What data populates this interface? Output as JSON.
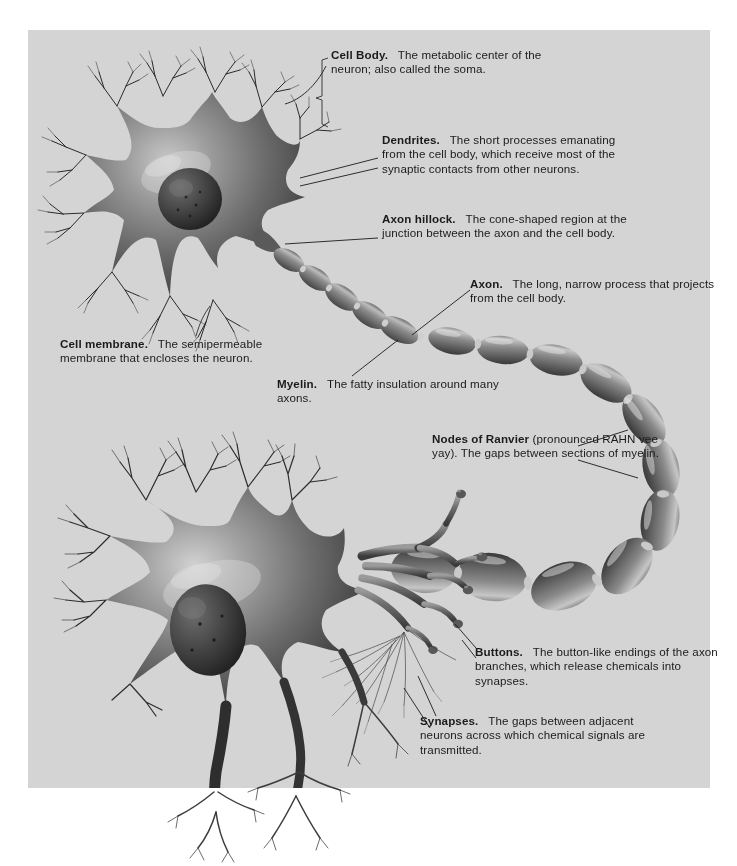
{
  "figure": {
    "panel_color": "#d4d4d4",
    "page_color": "#ffffff",
    "text_color": "#1b1b1b"
  },
  "callouts": [
    {
      "id": "cell-body",
      "term": "Cell Body.",
      "body": "The metabolic center of the neuron; also called the soma."
    },
    {
      "id": "dendrites",
      "term": "Dendrites.",
      "body": "The short processes emanating from the cell body, which receive most of the synaptic contacts from other neurons."
    },
    {
      "id": "axon-hillock",
      "term": "Axon hillock.",
      "body": "The cone-shaped region at the junction between the axon and the cell body."
    },
    {
      "id": "axon",
      "term": "Axon.",
      "body": "The long, narrow process that projects from the cell body."
    },
    {
      "id": "cell-membrane",
      "term": "Cell membrane.",
      "body": "The semipermeable membrane that encloses the neuron."
    },
    {
      "id": "myelin",
      "term": "Myelin.",
      "body": "The fatty insulation around many axons."
    },
    {
      "id": "nodes-of-ranvier",
      "term": "Nodes of Ranvier",
      "body": "(pronounced RAHN vee yay). The gaps between sections of myelin."
    },
    {
      "id": "buttons",
      "term": "Buttons.",
      "body": "The button-like endings of the axon branches, which release chemicals into synapses."
    },
    {
      "id": "synapses",
      "term": "Synapses.",
      "body": "The gaps between adjacent neurons across which chemical signals are transmitted."
    }
  ]
}
